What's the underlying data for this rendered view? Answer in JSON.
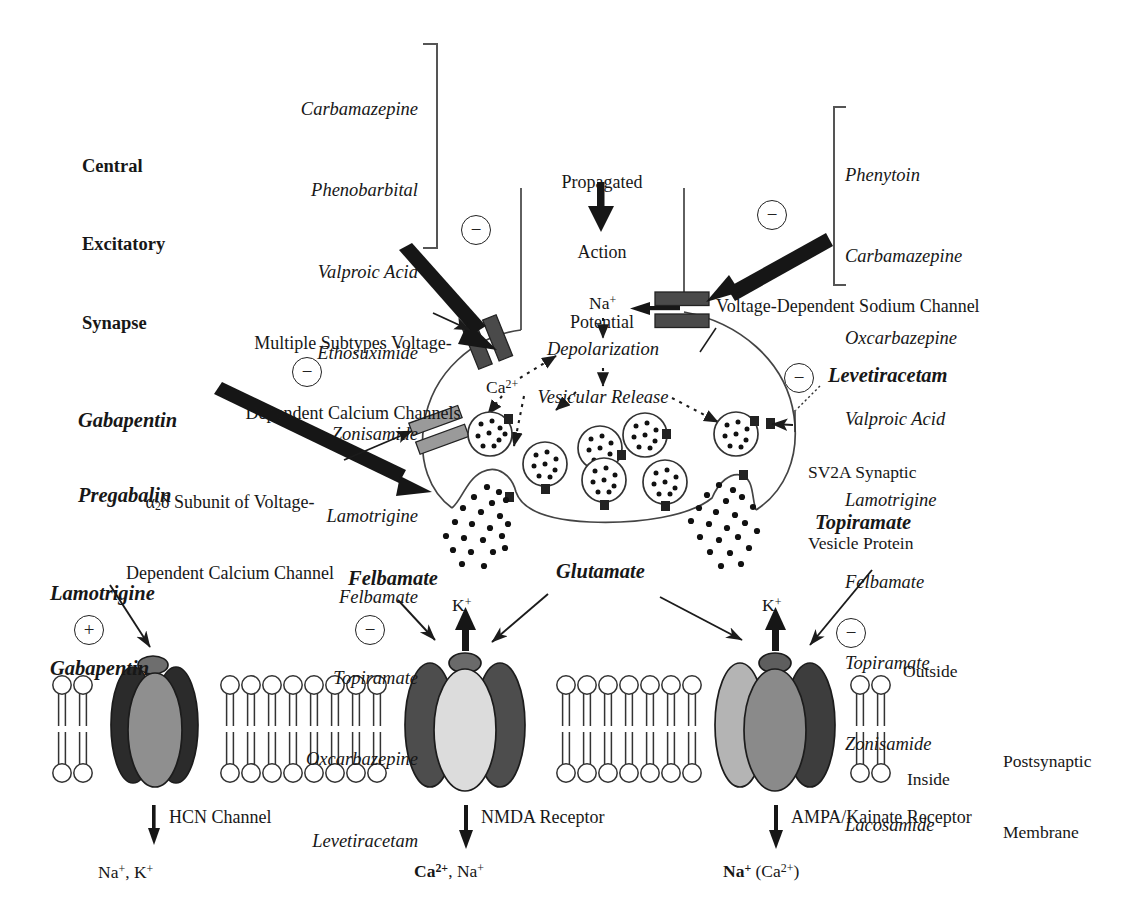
{
  "figure": {
    "title_lines": [
      "Central",
      "Excitatory",
      "Synapse"
    ],
    "postsynaptic_membrane_label": "Postsynaptic\nMembrane",
    "outside_label": "Outside",
    "inside_label": "Inside"
  },
  "drug_lists": {
    "calcium_channel_blockers": {
      "position": "top-left",
      "sign": "−",
      "items": [
        "Carbamazepine",
        "Phenobarbital",
        "Valproic Acid",
        "Ethosuximide",
        "Zonisamide",
        "Lamotrigine",
        "Felbamate",
        "Topiramate",
        "Oxcarbazepine",
        "Levetiracetam"
      ]
    },
    "sodium_channel_blockers": {
      "position": "top-right",
      "sign": "−",
      "items": [
        "Phenytoin",
        "Carbamazepine",
        "Oxcarbazepine",
        "Valproic Acid",
        "Lamotrigine",
        "Felbamate",
        "Topiramate",
        "Zonisamide",
        "Lacosamide"
      ]
    }
  },
  "annotations": {
    "propagated_action_potential": "Propagated\nAction\nPotential",
    "calcium_channel_subtypes": "Multiple Subtypes Voltage-\nDependent Calcium Channels",
    "sodium_channel": "Voltage-Dependent Sodium Channel",
    "alpha2delta_subunit_line1_pre": "α",
    "alpha2delta_subunit_line1_sub": "2",
    "alpha2delta_subunit_line1_post": "δ Subunit of Voltage-",
    "alpha2delta_subunit_line2": "Dependent Calcium Channel",
    "sv2a_protein": "SV2A Synaptic\nVesicle Protein",
    "depolarization": "Depolarization",
    "vesicular_release": "Vesicular Release"
  },
  "drug_callouts": {
    "gabapentin_pregabalin": {
      "lines": [
        "Gabapentin",
        "Pregabalin"
      ],
      "sign": "−"
    },
    "levetiracetam": {
      "lines": [
        "Levetiracetam"
      ],
      "sign": "−"
    },
    "lamotrigine_gabapentin": {
      "lines": [
        "Lamotrigine",
        "Gabapentin"
      ],
      "sign": "+"
    },
    "felbamate": {
      "lines": [
        "Felbamate"
      ],
      "sign": "−"
    },
    "topiramate": {
      "lines": [
        "Topiramate"
      ],
      "sign": "−"
    }
  },
  "neurotransmitter": {
    "label": "Glutamate"
  },
  "ions": {
    "sodium_terminal": {
      "element": "Na",
      "charge": "+"
    },
    "calcium_terminal": {
      "element": "Ca",
      "charge": "2+"
    },
    "potassium_nmda": {
      "element": "K",
      "charge": "+"
    },
    "potassium_ampa": {
      "element": "K",
      "charge": "+"
    }
  },
  "receptors": [
    {
      "id": "hcn",
      "name": "HCN Channel",
      "permeant_ions": [
        {
          "element": "Na",
          "charge": "+",
          "bold": false
        },
        {
          "element": "K",
          "charge": "+",
          "bold": false
        }
      ],
      "permeant_ions_text": "Na⁺, K⁺",
      "colors": {
        "outer": "#2b2b2b",
        "center": "#8f8f8f",
        "cap": "#6e6e6e"
      }
    },
    {
      "id": "nmda",
      "name": "NMDA Receptor",
      "permeant_ions": [
        {
          "element": "Ca",
          "charge": "2+",
          "bold": true
        },
        {
          "element": "Na",
          "charge": "+",
          "bold": false
        }
      ],
      "permeant_ions_text": "Ca²⁺, Na⁺",
      "colors": {
        "outer": "#4d4d4d",
        "center": "#dcdcdc",
        "cap": "#6a6a6a"
      }
    },
    {
      "id": "ampa",
      "name": "AMPA/Kainate Receptor",
      "permeant_ions": [
        {
          "element": "Na",
          "charge": "+",
          "bold": true
        },
        {
          "element": "Ca",
          "charge": "2+",
          "bold": false,
          "parenthesized": true
        }
      ],
      "permeant_ions_text": "Na⁺ (Ca²⁺)",
      "colors": {
        "outer_left": "#b4b4b4",
        "outer_right": "#3d3d3d",
        "center": "#8a8a8a",
        "cap": "#5e5e5e"
      }
    }
  ],
  "colors": {
    "ink": "#171717",
    "stroke": "#333333",
    "channel_bar_dark": "#4a4a4a",
    "channel_bar_light": "#9a9a9a",
    "membrane": "#333333",
    "background": "#ffffff"
  }
}
